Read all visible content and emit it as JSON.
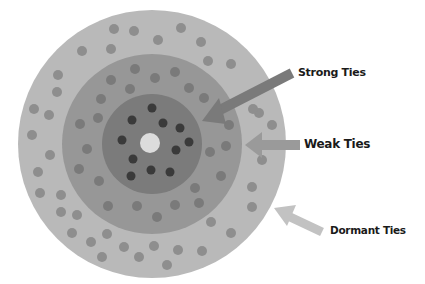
{
  "diagram": {
    "colors": {
      "background": "#ffffff",
      "outer_ring": "#b9b9b9",
      "middle_ring": "#979797",
      "inner_ring": "#7b7b7b",
      "center": "#dcdcdc",
      "outer_dots": "#8e8e8e",
      "middle_dots": "#7a7a7a",
      "inner_dots": "#3a3a3a",
      "arrow_strong": "#7a7a7a",
      "arrow_weak": "#9a9a9a",
      "arrow_dormant": "#c2c2c2"
    },
    "rings": [
      {
        "name": "Dormant Ties",
        "radius": 134
      },
      {
        "name": "Weak Ties",
        "radius": 90
      },
      {
        "name": "Strong Ties",
        "radius": 50
      }
    ],
    "labels": {
      "strong": "Strong Ties",
      "weak": "Weak Ties",
      "dormant": "Dormant Ties"
    }
  }
}
